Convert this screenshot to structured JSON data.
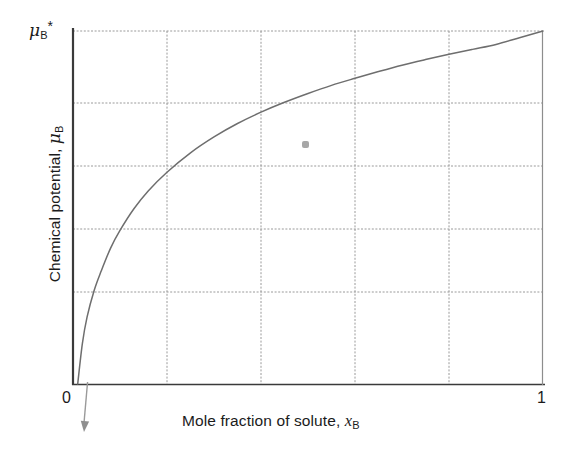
{
  "figure": {
    "background_color": "#ffffff",
    "plot": {
      "left": 73,
      "right": 543,
      "top": 31,
      "bottom": 384,
      "frame_color": "#3d3d3d",
      "grid_color": "#9a9a9a",
      "curve_color": "#6e6e6e",
      "arrow_color": "#8a8a8a"
    },
    "artifact": {
      "name": "gray-smudge",
      "x": 305,
      "y": 145,
      "color": "#8a8a8a"
    }
  },
  "labels": {
    "ylabel_text": "Chemical potential,",
    "ylabel_symbol": "μ",
    "ylabel_symbol_sub": "B",
    "xlabel_text": "Mole fraction of solute,",
    "xlabel_symbol": "x",
    "xlabel_symbol_sub": "B",
    "ytick_max_symbol": "μ",
    "ytick_max_sub": "B",
    "ytick_max_sup": "*",
    "xtick_min": "0",
    "xtick_max": "1"
  },
  "chart_data": {
    "type": "line",
    "title": "",
    "subtitle": "",
    "xlabel": "Mole fraction of solute, x_B",
    "ylabel": "Chemical potential, μ_B",
    "xlim": [
      0,
      1
    ],
    "ylim": [
      0,
      1
    ],
    "xticks": [
      0,
      1
    ],
    "xticklabels": [
      "0",
      "1"
    ],
    "yticks": [
      1
    ],
    "yticklabels": [
      "μ_B*"
    ],
    "grid": true,
    "grid_style": "dashed",
    "grid_x": [
      0.2,
      0.4,
      0.6,
      0.8
    ],
    "grid_y": [
      0.205,
      0.38,
      0.555,
      0.735,
      0.92
    ],
    "legend": null,
    "legend_position": null,
    "annotations": [
      {
        "type": "arrow",
        "note": "curve continues below axis toward minus infinity at x = 0",
        "from_x": 0.031,
        "from_y": 0.0,
        "to_x_px": 84,
        "to_y_px": 432
      }
    ],
    "series": [
      {
        "name": "mu_B = mu_B* + RT ln x_B",
        "description": "Logarithmic chemical potential of an ideal-dilute solute; rises steeply near x_B = 0 and reaches mu_B* at x_B = 1",
        "x": [
          0.0,
          0.005,
          0.01,
          0.02,
          0.03,
          0.045,
          0.06,
          0.08,
          0.1,
          0.13,
          0.16,
          0.2,
          0.25,
          0.3,
          0.35,
          0.4,
          0.45,
          0.5,
          0.55,
          0.6,
          0.65,
          0.7,
          0.75,
          0.8,
          0.85,
          0.9,
          0.95,
          1.0
        ],
        "y": [
          -0.4,
          -0.12,
          0.0,
          0.115,
          0.19,
          0.265,
          0.32,
          0.385,
          0.435,
          0.497,
          0.547,
          0.6,
          0.655,
          0.7,
          0.738,
          0.77,
          0.798,
          0.823,
          0.846,
          0.866,
          0.885,
          0.903,
          0.919,
          0.934,
          0.948,
          0.962,
          0.981,
          1.0
        ]
      }
    ]
  }
}
